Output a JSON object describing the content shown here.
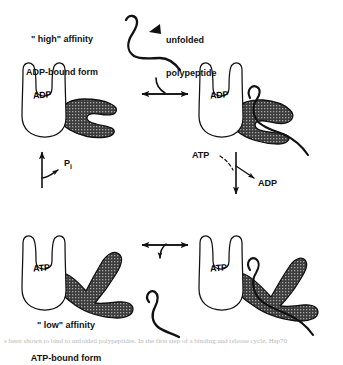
{
  "figure": {
    "ink_color": "#111111",
    "fill_dark": "#3a3a3a",
    "background": "#ffffff"
  },
  "labels": {
    "top_left_form_line1": "\" high\" affinity",
    "top_left_form_line2": "ADP-bound form",
    "bottom_left_form_line1": "\" low\" affinity",
    "bottom_left_form_line2": "ATP-bound form",
    "unfolded_line1": "unfolded",
    "unfolded_line2": "polypeptide",
    "phosphate": "P",
    "phosphate_subscript": "i",
    "atp_in": "ATP",
    "adp_out": "ADP"
  },
  "states": {
    "top_left": {
      "nucleotide": "ADP",
      "affinity": "high",
      "has_substrate": false
    },
    "top_right": {
      "nucleotide": "ADP",
      "affinity": "high",
      "has_substrate": true
    },
    "bottom_left": {
      "nucleotide": "ATP",
      "affinity": "low",
      "has_substrate": false
    },
    "bottom_right": {
      "nucleotide": "ATP",
      "affinity": "low",
      "has_substrate": true
    }
  },
  "arrows": {
    "top_equilibrium": "bidirectional-horizontal",
    "bottom_equilibrium": "bidirectional-horizontal",
    "left_vertical": "up",
    "right_vertical": "down"
  },
  "caption": {
    "line": "s been shown to bind to unfolded polypeptides. In the first step of a binding and release cycle, Hsp70"
  }
}
